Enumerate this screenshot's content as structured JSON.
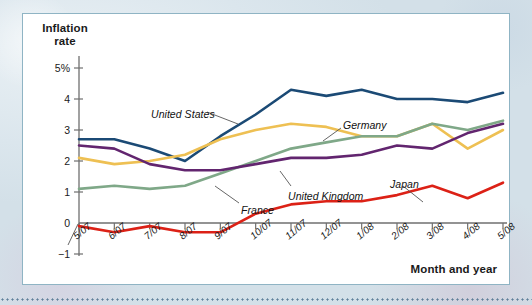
{
  "figure": {
    "y_axis_title": "Inflation rate",
    "x_axis_title": "Month and year"
  },
  "chart_data": {
    "type": "line",
    "title": "",
    "subtitle": "",
    "xlabel": "Month and year",
    "ylabel": "Inflation rate",
    "ylim": [
      -1,
      5.6
    ],
    "xlim": [
      0,
      12
    ],
    "grid": false,
    "legend_position": "inline-annotations",
    "y_ticks": [
      5,
      4,
      3,
      2,
      1,
      0,
      -1
    ],
    "y_tick_labels": [
      "5%",
      "4",
      "3",
      "2",
      "1",
      "0",
      "−1"
    ],
    "categories": [
      "5/07",
      "6/07",
      "7/07",
      "8/07",
      "9/07",
      "10/07",
      "11/07",
      "12/07",
      "1/08",
      "2/08",
      "3/08",
      "4/08",
      "5/08"
    ],
    "series": [
      {
        "name": "United States",
        "color": "#1b4a75",
        "label_x": 128,
        "label_y": 94,
        "leader": [
          [
            184,
            98
          ],
          [
            215,
            110
          ]
        ],
        "values": [
          2.7,
          2.7,
          2.4,
          2.0,
          2.8,
          3.5,
          4.3,
          4.1,
          4.3,
          4.0,
          4.0,
          3.9,
          4.2
        ]
      },
      {
        "name": "Germany",
        "color": "#eec053",
        "label_x": 320,
        "label_y": 105,
        "leader": [
          [
            318,
            114
          ],
          [
            300,
            127
          ]
        ],
        "values": [
          2.1,
          1.9,
          2.0,
          2.2,
          2.7,
          3.0,
          3.2,
          3.1,
          2.8,
          2.8,
          3.2,
          2.4,
          3.0
        ]
      },
      {
        "name": "France",
        "color": "#7fa888",
        "label_x": 218,
        "label_y": 190,
        "leader": [
          [
            216,
            189
          ],
          [
            192,
            172
          ]
        ],
        "values": [
          1.1,
          1.2,
          1.1,
          1.2,
          1.6,
          2.0,
          2.4,
          2.6,
          2.8,
          2.8,
          3.2,
          3.0,
          3.3
        ]
      },
      {
        "name": "United Kingdom",
        "color": "#62256f",
        "label_x": 265,
        "label_y": 176,
        "leader": [
          [
            268,
            172
          ],
          [
            257,
            157
          ]
        ],
        "values": [
          2.5,
          2.4,
          1.9,
          1.7,
          1.7,
          1.9,
          2.1,
          2.1,
          2.2,
          2.5,
          2.4,
          2.9,
          3.2
        ]
      },
      {
        "name": "Japan",
        "color": "#dc2116",
        "label_x": 367,
        "label_y": 164,
        "leader": [
          [
            380,
            172
          ],
          [
            400,
            188
          ]
        ],
        "values": [
          -0.1,
          -0.3,
          -0.1,
          -0.3,
          -0.3,
          0.3,
          0.6,
          0.7,
          0.7,
          0.9,
          1.2,
          0.8,
          1.3
        ]
      }
    ]
  },
  "colors": {
    "panel_border": "#8fb4c4",
    "axis": "#6f6f6f",
    "page_background": "#dfe8ee"
  }
}
